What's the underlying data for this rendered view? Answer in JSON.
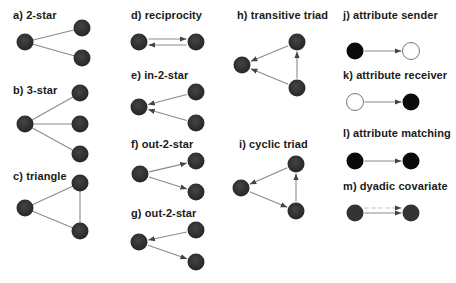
{
  "colors": {
    "node_fill": "#333333",
    "node_black": "#0a0a0a",
    "node_white": "#ffffff",
    "node_outline": "#777777",
    "edge": "#8a8a8a",
    "arrow": "#555555",
    "dashed": "#bbbbbb",
    "text": "#1a1a1a"
  },
  "panels": [
    {
      "id": "a",
      "label": "a) 2-star",
      "label_pos": [
        13,
        9
      ],
      "type": "undirected",
      "nodes": [
        [
          25,
          42
        ],
        [
          82,
          28
        ],
        [
          82,
          58
        ]
      ],
      "edges": [
        [
          0,
          1
        ],
        [
          0,
          2
        ]
      ]
    },
    {
      "id": "b",
      "label": "b) 3-star",
      "label_pos": [
        13,
        84
      ],
      "type": "undirected",
      "nodes": [
        [
          25,
          124
        ],
        [
          80,
          93
        ],
        [
          80,
          124
        ],
        [
          80,
          154
        ]
      ],
      "edges": [
        [
          0,
          1
        ],
        [
          0,
          2
        ],
        [
          0,
          3
        ]
      ]
    },
    {
      "id": "c",
      "label": "c) triangle",
      "label_pos": [
        13,
        170
      ],
      "type": "undirected",
      "nodes": [
        [
          25,
          208
        ],
        [
          80,
          183
        ],
        [
          80,
          231
        ]
      ],
      "edges": [
        [
          0,
          1
        ],
        [
          0,
          2
        ],
        [
          1,
          2
        ]
      ]
    },
    {
      "id": "d",
      "label": "d) reciprocity",
      "label_pos": [
        131,
        9
      ],
      "type": "reciprocal",
      "nodes": [
        [
          139,
          42
        ],
        [
          196,
          42
        ]
      ],
      "edges": [
        [
          0,
          1
        ],
        [
          1,
          0
        ]
      ]
    },
    {
      "id": "e",
      "label": "e) in-2-star",
      "label_pos": [
        131,
        69
      ],
      "type": "directed",
      "nodes": [
        [
          139,
          107
        ],
        [
          196,
          92
        ],
        [
          196,
          123
        ]
      ],
      "edges": [
        [
          1,
          0
        ],
        [
          2,
          0
        ]
      ]
    },
    {
      "id": "f",
      "label": "f) out-2-star",
      "label_pos": [
        131,
        138
      ],
      "type": "directed",
      "nodes": [
        [
          140,
          174
        ],
        [
          196,
          161
        ],
        [
          196,
          192
        ]
      ],
      "edges": [
        [
          0,
          1
        ],
        [
          0,
          2
        ]
      ]
    },
    {
      "id": "g",
      "label": "g) out-2-star",
      "label_pos": [
        131,
        207
      ],
      "type": "directed",
      "nodes": [
        [
          139,
          242
        ],
        [
          196,
          230
        ],
        [
          196,
          262
        ]
      ],
      "edges": [
        [
          1,
          0
        ],
        [
          0,
          2
        ]
      ]
    },
    {
      "id": "h",
      "label": "h) transitive triad",
      "label_pos": [
        237,
        9
      ],
      "type": "directed",
      "nodes": [
        [
          242,
          65
        ],
        [
          297,
          42
        ],
        [
          297,
          88
        ]
      ],
      "edges": [
        [
          1,
          0
        ],
        [
          2,
          0
        ],
        [
          2,
          1
        ]
      ]
    },
    {
      "id": "i",
      "label": "i) cyclic triad",
      "label_pos": [
        239,
        138
      ],
      "type": "directed",
      "nodes": [
        [
          241,
          188
        ],
        [
          296,
          164
        ],
        [
          296,
          211
        ]
      ],
      "edges": [
        [
          1,
          0
        ],
        [
          0,
          2
        ],
        [
          2,
          1
        ]
      ]
    },
    {
      "id": "j",
      "label": "j) attribute sender",
      "label_pos": [
        343,
        9
      ],
      "type": "attribute",
      "nodes": [
        [
          355,
          51
        ],
        [
          411,
          51
        ]
      ],
      "node_styles": [
        "black",
        "white"
      ],
      "edges": [
        [
          0,
          1
        ]
      ]
    },
    {
      "id": "k",
      "label": "k) attribute receiver",
      "label_pos": [
        343,
        69
      ],
      "type": "attribute",
      "nodes": [
        [
          355,
          102
        ],
        [
          411,
          102
        ]
      ],
      "node_styles": [
        "white",
        "black"
      ],
      "edges": [
        [
          0,
          1
        ]
      ]
    },
    {
      "id": "l",
      "label": "l) attribute matching",
      "label_pos": [
        343,
        127
      ],
      "type": "attribute",
      "nodes": [
        [
          355,
          161
        ],
        [
          411,
          161
        ]
      ],
      "node_styles": [
        "black",
        "black"
      ],
      "edges": [
        [
          0,
          1
        ]
      ]
    },
    {
      "id": "m",
      "label": "m) dyadic covariate",
      "label_pos": [
        343,
        180
      ],
      "type": "dyadic",
      "nodes": [
        [
          355,
          213
        ],
        [
          411,
          213
        ]
      ],
      "node_styles": [
        "dark",
        "dark"
      ],
      "edges": [
        [
          0,
          1
        ]
      ]
    }
  ]
}
